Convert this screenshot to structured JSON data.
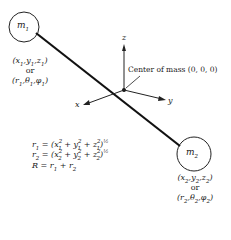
{
  "diagram": {
    "mass1": {
      "label": "m",
      "label_sub": "1",
      "cartesian": "(x1, y1, z1)",
      "or": "or",
      "spherical": "(r1, θ1, φ1)"
    },
    "mass2": {
      "label": "m",
      "label_sub": "2",
      "cartesian": "(x2, y2, z2)",
      "or": "or",
      "spherical": "(r2, θ2, φ2)"
    },
    "axes": {
      "x": "x",
      "y": "y",
      "z": "z"
    },
    "center_label": "Center of mass (0, 0, 0)",
    "equations": [
      "r1 = (x1² + y1² + z1²)^½",
      "r2 = (x2² + y2² + z2²)^½",
      "R = r1 + r2"
    ]
  }
}
